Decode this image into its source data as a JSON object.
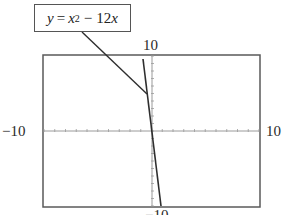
{
  "chart_data": {
    "type": "line",
    "title": "",
    "function": "y = x^2 - 12x",
    "label": {
      "y": "y",
      "eq": "=",
      "x": "x",
      "exp": "2",
      "minus": "−",
      "coef": "12",
      "x2": "x"
    },
    "xlim": [
      -10,
      10
    ],
    "ylim": [
      -10,
      10
    ],
    "x_tick_step": 1,
    "y_tick_step": 1,
    "window_labels": {
      "ymax": "10",
      "ymin": "−10",
      "xmin": "−10",
      "xmax": "10"
    },
    "grid": false,
    "series": [
      {
        "name": "y = x^2 - 12x",
        "x": [
          -0.8,
          -0.5,
          0,
          0.5,
          0.8
        ],
        "y": [
          10.24,
          6.25,
          0,
          -5.75,
          -8.96
        ]
      }
    ],
    "colors": {
      "curve": "#333333",
      "frame": "#555555",
      "axis": "#888888"
    }
  }
}
